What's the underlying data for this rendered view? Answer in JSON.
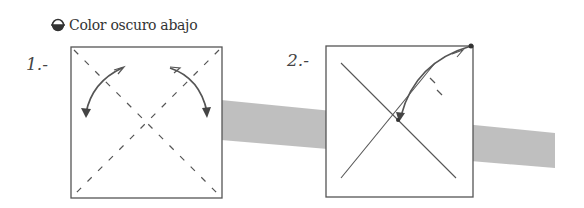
{
  "legend": {
    "icon": "half-filled-circle-icon",
    "label": "Color oscuro abajo"
  },
  "steps": [
    {
      "number": "1.-",
      "description": "Square with dashed diagonal valley folds and two curved arrows folding top corners down"
    },
    {
      "number": "2.-",
      "description": "Square with solid diagonals; top-right corner folded to center along arrow"
    }
  ],
  "colors": {
    "line": "#555555",
    "band": "#b8b8b8",
    "text": "#333333"
  }
}
